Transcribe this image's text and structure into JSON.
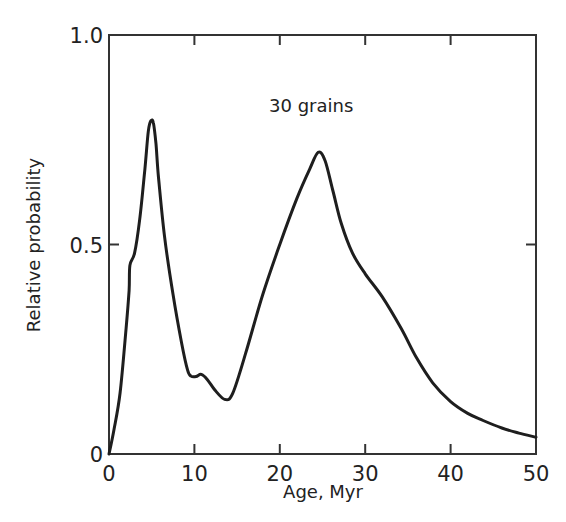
{
  "chart_data": {
    "type": "line",
    "title": "",
    "annotation": "30 grains",
    "xlabel": "Age, Myr",
    "ylabel": "Relative probability",
    "xlim": [
      0,
      50
    ],
    "ylim": [
      0,
      1.0
    ],
    "xticks": [
      0,
      10,
      20,
      30,
      40,
      50
    ],
    "xtick_labels": [
      "0",
      "10",
      "20",
      "30",
      "40",
      "50"
    ],
    "yticks": [
      0,
      0.5,
      1.0
    ],
    "ytick_labels": [
      "0",
      "0.5",
      "1.0"
    ],
    "grid": false,
    "legend": null,
    "series": [
      {
        "name": "Relative probability",
        "x": [
          0,
          0.6,
          1.3,
          2.0,
          2.35,
          2.45,
          3.0,
          3.6,
          4.2,
          4.6,
          4.9,
          5.2,
          5.5,
          5.8,
          6.5,
          7.5,
          8.5,
          9.2,
          9.6,
          10.2,
          10.8,
          11.5,
          12.5,
          13.6,
          14.5,
          16,
          18,
          20,
          22,
          23.5,
          24.5,
          25.3,
          26.2,
          27.2,
          28.5,
          30,
          32,
          34.2,
          36,
          37.9,
          40,
          42,
          43.8,
          46,
          48,
          50
        ],
        "y": [
          0,
          0.06,
          0.146,
          0.3,
          0.39,
          0.45,
          0.48,
          0.56,
          0.68,
          0.77,
          0.795,
          0.79,
          0.74,
          0.66,
          0.52,
          0.38,
          0.265,
          0.2,
          0.186,
          0.185,
          0.19,
          0.178,
          0.15,
          0.13,
          0.145,
          0.24,
          0.38,
          0.5,
          0.61,
          0.68,
          0.72,
          0.7,
          0.63,
          0.55,
          0.48,
          0.43,
          0.375,
          0.3,
          0.23,
          0.17,
          0.125,
          0.097,
          0.08,
          0.062,
          0.05,
          0.04
        ]
      }
    ]
  },
  "plot": {
    "line_color": "#1e1e1e",
    "axis_color": "#333333"
  }
}
